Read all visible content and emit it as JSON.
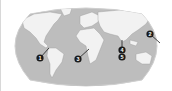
{
  "map": {
    "type": "world-map",
    "projection": "Robinson",
    "colors": {
      "ocean": "#bdbdbd",
      "land": "#f2f2f2",
      "land_outline": "#9a9a9a",
      "marker": "#1a1a1a",
      "marker_text": "#ffffff",
      "background": "#ffffff"
    },
    "markers": [
      {
        "id": "1",
        "label": "1",
        "region": "Central America",
        "x": 40,
        "y": 58,
        "target_x": 49,
        "target_y": 48
      },
      {
        "id": "2",
        "label": "2",
        "region": "Western Pacific",
        "x": 150,
        "y": 34,
        "target_x": 160,
        "target_y": 43
      },
      {
        "id": "3",
        "label": "3",
        "region": "West Africa",
        "x": 78,
        "y": 59,
        "target_x": 89,
        "target_y": 49
      },
      {
        "id": "4",
        "label": "4",
        "region": "South Asia",
        "x": 122,
        "y": 50,
        "target_x": 122,
        "target_y": 40
      },
      {
        "id": "5",
        "label": "5",
        "region": "Indian Ocean",
        "x": 122,
        "y": 57,
        "target_x": 122,
        "target_y": 57
      }
    ]
  }
}
